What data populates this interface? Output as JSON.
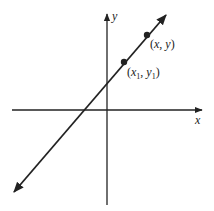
{
  "diagram": {
    "type": "coordinate-plane-line",
    "axes": {
      "x_label": "x",
      "y_label": "y"
    },
    "points": [
      {
        "label": "(x, y)",
        "base": "x",
        "y_base": "y"
      },
      {
        "label": "(x1, y1)",
        "base": "x",
        "sub": "1",
        "y_base": "y",
        "y_sub": "1"
      }
    ],
    "colors": {
      "stroke": "#222222",
      "background": "#ffffff"
    }
  },
  "labels": {
    "x_axis": "x",
    "y_axis": "y",
    "point_xy_open": "(",
    "point_xy_x": "x",
    "point_xy_comma": ", ",
    "point_xy_y": "y",
    "point_xy_close": ")",
    "p1_open": "(",
    "p1_x": "x",
    "p1_xsub": "1",
    "p1_comma": ", ",
    "p1_y": "y",
    "p1_ysub": "1",
    "p1_close": ")"
  }
}
